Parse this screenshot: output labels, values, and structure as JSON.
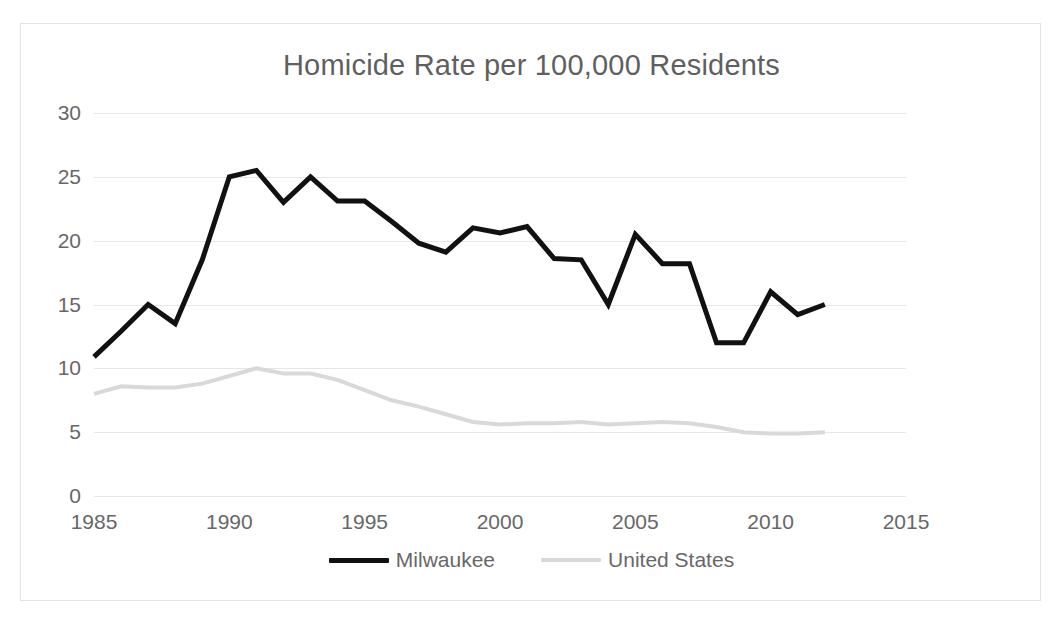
{
  "chart_data": {
    "type": "line",
    "title": "Homicide Rate per 100,000 Residents",
    "xlabel": "",
    "ylabel": "",
    "xlim": [
      1985,
      2015
    ],
    "ylim": [
      0,
      30
    ],
    "xticks": [
      1985,
      1990,
      1995,
      2000,
      2005,
      2010,
      2015
    ],
    "yticks": [
      0,
      5,
      10,
      15,
      20,
      25,
      30
    ],
    "grid": "horizontal",
    "legend_position": "bottom-center",
    "x": [
      1985,
      1986,
      1987,
      1988,
      1989,
      1990,
      1991,
      1992,
      1993,
      1994,
      1995,
      1996,
      1997,
      1998,
      1999,
      2000,
      2001,
      2002,
      2003,
      2004,
      2005,
      2006,
      2007,
      2008,
      2009,
      2010,
      2011,
      2012
    ],
    "series": [
      {
        "name": "Milwaukee",
        "color": "#111111",
        "width": 5,
        "values": [
          10.9,
          12.9,
          15.0,
          13.5,
          18.5,
          25.0,
          25.5,
          23.0,
          25.0,
          23.1,
          23.1,
          21.5,
          19.8,
          19.1,
          21.0,
          20.6,
          21.1,
          18.6,
          18.5,
          15.0,
          20.5,
          18.2,
          18.2,
          12.0,
          12.0,
          16.0,
          14.2,
          15.0
        ]
      },
      {
        "name": "United States",
        "color": "#d9d9d9",
        "width": 4,
        "values": [
          8.0,
          8.6,
          8.5,
          8.5,
          8.8,
          9.4,
          10.0,
          9.6,
          9.6,
          9.1,
          8.3,
          7.5,
          7.0,
          6.4,
          5.8,
          5.6,
          5.7,
          5.7,
          5.8,
          5.6,
          5.7,
          5.8,
          5.7,
          5.4,
          5.0,
          4.9,
          4.9,
          5.0
        ]
      }
    ]
  }
}
